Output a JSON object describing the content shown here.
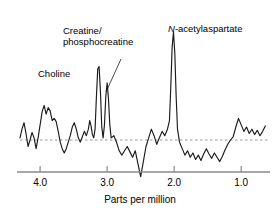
{
  "chart_data": {
    "type": "line",
    "title": "",
    "subtitle": "",
    "xlabel": "Parts per million",
    "ylabel": "",
    "xticks": [
      4.0,
      3.0,
      2.0,
      1.0
    ],
    "xtick_labels": [
      "4.0",
      "3.0",
      "2.0",
      "1.0"
    ],
    "xlim": [
      4.3,
      0.6
    ],
    "x_axis_reversed": true,
    "grid": false,
    "baseline": 0,
    "baseline_style": "dashed",
    "legend": "none",
    "annotations": [
      {
        "name": "choline",
        "text": "Choline",
        "ppm": 3.2,
        "leader": false
      },
      {
        "name": "creatine-phosphocreatine",
        "text_line1": "Creatine/",
        "text_line2": "phosphocreatine",
        "ppm": 3.02,
        "leader": true
      },
      {
        "name": "n-acetylaspartate",
        "text_italic_prefix": "N",
        "text_rest": "-acetylaspartate",
        "ppm": 2.01,
        "leader": false
      }
    ],
    "peaks": [
      {
        "label": "Choline",
        "ppm": 3.2,
        "relative_height": 0.68
      },
      {
        "label": "Creatine/phosphocreatine",
        "ppm": 3.02,
        "relative_height": 0.53
      },
      {
        "label": "N-acetylaspartate",
        "ppm": 2.01,
        "relative_height": 1.0
      }
    ],
    "x": [
      4.3,
      4.27,
      4.24,
      4.21,
      4.18,
      4.15,
      4.12,
      4.09,
      4.06,
      4.03,
      4.0,
      3.97,
      3.94,
      3.91,
      3.88,
      3.85,
      3.82,
      3.79,
      3.76,
      3.73,
      3.7,
      3.67,
      3.64,
      3.61,
      3.58,
      3.55,
      3.52,
      3.49,
      3.46,
      3.43,
      3.4,
      3.37,
      3.34,
      3.31,
      3.28,
      3.26,
      3.24,
      3.22,
      3.2,
      3.18,
      3.16,
      3.14,
      3.12,
      3.1,
      3.08,
      3.06,
      3.04,
      3.02,
      3.0,
      2.98,
      2.96,
      2.94,
      2.9,
      2.86,
      2.82,
      2.78,
      2.74,
      2.7,
      2.66,
      2.62,
      2.58,
      2.54,
      2.5,
      2.46,
      2.42,
      2.38,
      2.34,
      2.3,
      2.26,
      2.22,
      2.18,
      2.14,
      2.1,
      2.07,
      2.05,
      2.03,
      2.01,
      1.99,
      1.97,
      1.95,
      1.92,
      1.88,
      1.84,
      1.8,
      1.76,
      1.72,
      1.68,
      1.64,
      1.6,
      1.56,
      1.52,
      1.48,
      1.44,
      1.4,
      1.36,
      1.32,
      1.28,
      1.24,
      1.2,
      1.16,
      1.12,
      1.08,
      1.04,
      1.0,
      0.96,
      0.92,
      0.88,
      0.84,
      0.8,
      0.76,
      0.72,
      0.68,
      0.64,
      0.6
    ],
    "y": [
      0.02,
      0.1,
      0.16,
      0.06,
      -0.06,
      0.0,
      0.07,
      0.02,
      -0.08,
      0.02,
      0.14,
      0.26,
      0.32,
      0.24,
      0.3,
      0.27,
      0.18,
      0.2,
      0.17,
      0.08,
      -0.02,
      -0.08,
      -0.12,
      -0.08,
      -0.02,
      0.04,
      0.12,
      0.16,
      0.1,
      0.02,
      -0.02,
      0.03,
      0.08,
      0.04,
      0.1,
      0.18,
      0.13,
      0.05,
      0.02,
      0.1,
      0.4,
      0.66,
      0.68,
      0.45,
      0.12,
      0.02,
      0.14,
      0.4,
      0.53,
      0.38,
      0.14,
      0.02,
      0.04,
      -0.02,
      -0.1,
      -0.14,
      -0.1,
      -0.06,
      -0.11,
      -0.16,
      -0.1,
      -0.22,
      -0.34,
      -0.2,
      -0.06,
      0.02,
      0.1,
      0.04,
      -0.04,
      0.02,
      0.08,
      0.04,
      0.1,
      0.18,
      0.5,
      0.86,
      1.0,
      0.8,
      0.4,
      0.1,
      -0.02,
      -0.08,
      -0.14,
      -0.1,
      -0.16,
      -0.12,
      -0.18,
      -0.14,
      -0.19,
      -0.13,
      -0.08,
      -0.13,
      -0.17,
      -0.12,
      -0.16,
      -0.2,
      -0.15,
      -0.09,
      -0.04,
      0.0,
      0.03,
      0.12,
      0.2,
      0.14,
      0.08,
      0.12,
      0.06,
      0.1,
      0.05,
      0.09,
      0.04,
      0.08,
      0.13
    ]
  },
  "axis": {
    "title": "Parts per million",
    "tick_labels": [
      "4.0",
      "3.0",
      "2.0",
      "1.0"
    ]
  },
  "labels": {
    "choline": "Choline",
    "creatine_line1": "Creatine/",
    "creatine_line2": "phosphocreatine",
    "naa_italic": "N",
    "naa_rest": "-acetylaspartate"
  },
  "colors": {
    "trace": "#1a1a1a",
    "baseline": "#8a8a8a",
    "axis": "#8a8a8a",
    "text": "#000000",
    "background": "#ffffff"
  }
}
